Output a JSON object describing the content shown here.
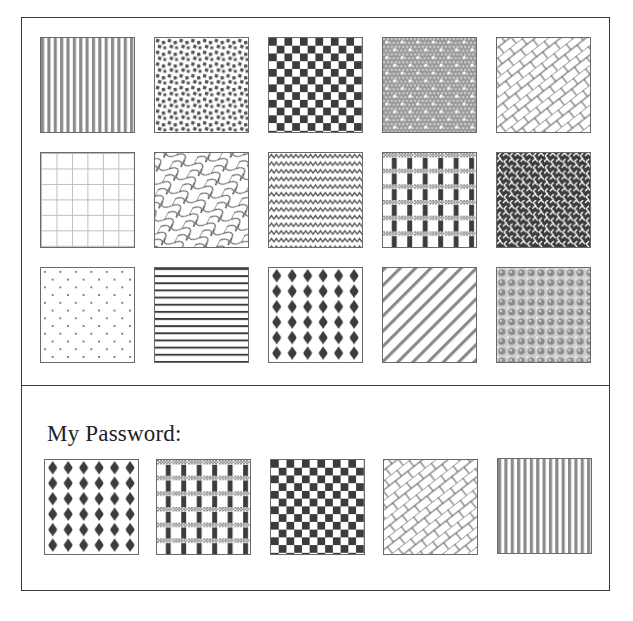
{
  "grid": {
    "rows": [
      [
        "vertical-stripes",
        "scattered-squares",
        "checkerboard",
        "gray-dotted-mesh",
        "diagonal-bricks"
      ],
      [
        "light-grid",
        "diagonal-scales",
        "zigzag-waves",
        "woven-plaid",
        "herringbone-weave"
      ],
      [
        "sparse-dots",
        "horizontal-stripes",
        "dark-diamonds",
        "diagonal-stripes",
        "beaded-circles"
      ]
    ]
  },
  "password": {
    "label": "My Password:",
    "tiles": [
      "dark-diamonds",
      "woven-plaid",
      "checkerboard",
      "diagonal-bricks",
      "vertical-stripes"
    ]
  },
  "colors": {
    "ink": "#555555",
    "dark": "#3c3c3c",
    "mid": "#8a8a8a",
    "light": "#bdbdbd",
    "paper": "#ffffff"
  }
}
